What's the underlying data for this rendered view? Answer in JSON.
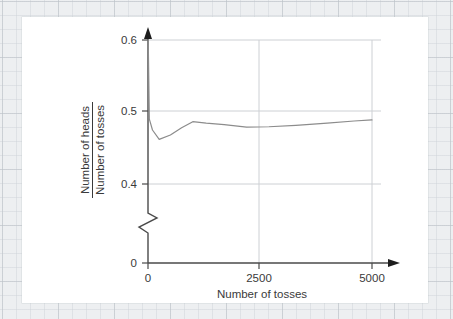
{
  "chart_data": {
    "type": "line",
    "title": "",
    "xlabel": "Number of tosses",
    "ylabel_numerator": "Number of heads",
    "ylabel_denominator": "Number of tosses",
    "xlim": [
      0,
      5000
    ],
    "ylim": [
      0.4,
      0.6
    ],
    "y_axis_break": true,
    "y_break_low": 0,
    "grid": true,
    "legend": null,
    "xticks": [
      0,
      2500,
      5000
    ],
    "xtick_labels": [
      "0",
      "2500",
      "5000"
    ],
    "yticks": [
      0,
      0.4,
      0.5,
      0.6
    ],
    "ytick_labels": [
      "0",
      "0.4",
      "0.5",
      "0.6"
    ],
    "series": [
      {
        "name": "Proportion of heads",
        "x": [
          5,
          30,
          100,
          250,
          500,
          750,
          1000,
          1300,
          1700,
          2200,
          2700,
          3300,
          4000,
          4600,
          5000
        ],
        "values": [
          0.6,
          0.49,
          0.475,
          0.462,
          0.468,
          0.478,
          0.4865,
          0.4845,
          0.4825,
          0.479,
          0.4795,
          0.4815,
          0.4845,
          0.4875,
          0.489
        ]
      }
    ],
    "colors": {
      "line": "#8c8c8c",
      "axis": "#4a4a4a",
      "grid": "#c9ccd0",
      "card": "#ffffff",
      "page": "#edeff1"
    }
  },
  "axis_labels": {
    "x_title": "Number of tosses",
    "y_numerator": "Number of heads",
    "y_denominator": "Number of tosses",
    "x_tick_0": "0",
    "x_tick_1": "2500",
    "x_tick_2": "5000",
    "y_tick_0": "0",
    "y_tick_1": "0.4",
    "y_tick_2": "0.5",
    "y_tick_3": "0.6"
  }
}
